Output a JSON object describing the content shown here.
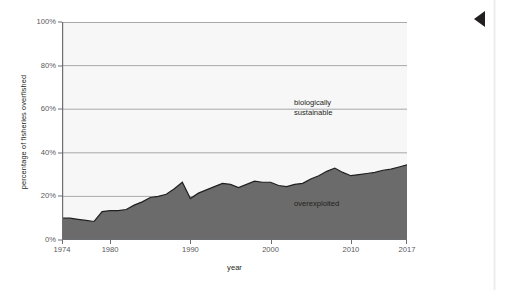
{
  "chart_data": {
    "type": "area",
    "title": "",
    "subtitle": "",
    "xlabel": "year",
    "ylabel": "percentage of fisheries overfished",
    "xlim": [
      1974,
      2017
    ],
    "ylim": [
      0,
      100
    ],
    "grid": true,
    "legend_position": "in-plot-right",
    "y_ticks": [
      "0%",
      "20%",
      "40%",
      "60%",
      "80%",
      "100%"
    ],
    "y_tick_values": [
      0,
      20,
      40,
      60,
      80,
      100
    ],
    "x_ticks": [
      "1974",
      "1980",
      "1990",
      "2000",
      "2010",
      "2017"
    ],
    "x_tick_values": [
      1974,
      1980,
      1990,
      2000,
      2010,
      2017
    ],
    "annotations": [
      {
        "name": "biologically-sustainable",
        "text": "biologically\nsustainable",
        "x": 2003,
        "y": 63
      },
      {
        "name": "overexploited",
        "text": "overexploited",
        "x": 2003,
        "y": 17
      }
    ],
    "series": [
      {
        "name": "overexploited",
        "fill_color": "#6b6b6b",
        "line_color": "#231f20",
        "x": [
          1974,
          1975,
          1976,
          1977,
          1978,
          1979,
          1980,
          1981,
          1982,
          1983,
          1984,
          1985,
          1986,
          1987,
          1988,
          1989,
          1990,
          1991,
          1992,
          1993,
          1994,
          1995,
          1996,
          1997,
          1998,
          1999,
          2000,
          2001,
          2002,
          2003,
          2004,
          2005,
          2006,
          2007,
          2008,
          2009,
          2010,
          2011,
          2012,
          2013,
          2014,
          2015,
          2016,
          2017
        ],
        "values": [
          10,
          10,
          9.5,
          9,
          8.5,
          13,
          13.5,
          13.5,
          14,
          16,
          17.5,
          19.5,
          20,
          21,
          23.5,
          26.5,
          19,
          21.5,
          23,
          24.5,
          26,
          25.5,
          24,
          25.5,
          27,
          26.5,
          26.5,
          25,
          24.5,
          25.5,
          26,
          28,
          29.5,
          31.5,
          33,
          31,
          29.5,
          30,
          30.5,
          31,
          32,
          32.5,
          33.5,
          34.5
        ]
      },
      {
        "name": "biologically sustainable",
        "fill_color": "#f7f7f7",
        "line_color": "#a7a9ac",
        "description": "remainder above the overexploited area up to 100%"
      }
    ]
  },
  "chrome": {
    "nav_arrow": "prev-page-arrow",
    "page_edge": "page-edge"
  }
}
